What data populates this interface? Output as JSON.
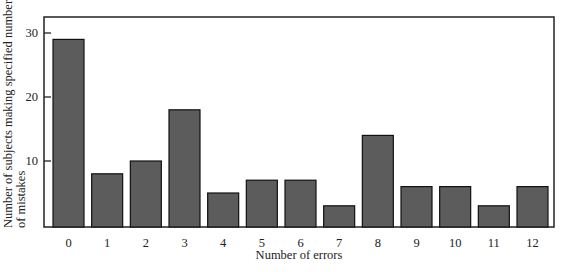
{
  "chart_data": {
    "type": "bar",
    "title": "",
    "xlabel": "Number of errors",
    "ylabel": "Number of subjects making specified number of mistakes",
    "ylabel_lines": [
      "Number of subjects making specified number",
      "of mistakes"
    ],
    "categories": [
      "0",
      "1",
      "2",
      "3",
      "4",
      "5",
      "6",
      "7",
      "8",
      "9",
      "10",
      "11",
      "12"
    ],
    "values": [
      29,
      8,
      10,
      18,
      5,
      7,
      7,
      3,
      14,
      6,
      6,
      3,
      6
    ],
    "yticks": [
      10,
      20,
      30
    ],
    "ylim": [
      0,
      33
    ],
    "grid": false,
    "legend": null,
    "bar_color": "#5c5c5c",
    "bar_edge_color": "#111111"
  }
}
